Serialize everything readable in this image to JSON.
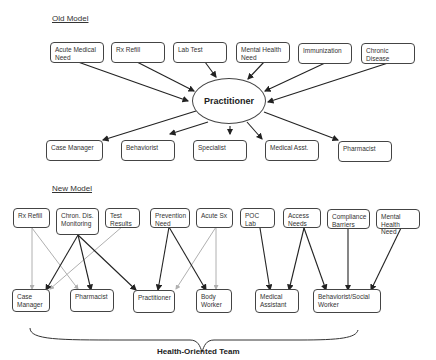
{
  "old_model": {
    "title": "Old Model",
    "center": "Practitioner",
    "inputs": [
      {
        "label": "Acute Medical Need"
      },
      {
        "label": "Rx Refill"
      },
      {
        "label": "Lab Test"
      },
      {
        "label": "Mental Health Need"
      },
      {
        "label": "Immunization"
      },
      {
        "label": "Chronic Disease"
      }
    ],
    "outputs": [
      {
        "label": "Case Manager"
      },
      {
        "label": "Behaviorist"
      },
      {
        "label": "Specialist"
      },
      {
        "label": "Medical Asst."
      },
      {
        "label": "Pharmacist"
      }
    ]
  },
  "new_model": {
    "title": "New Model",
    "inputs": [
      {
        "label": "Rx Refill"
      },
      {
        "label": "Chron. Dis. Monitoring"
      },
      {
        "label": "Test Results"
      },
      {
        "label": "Prevention Need"
      },
      {
        "label": "Acute Sx"
      },
      {
        "label": "POC Lab"
      },
      {
        "label": "Access Needs"
      },
      {
        "label": "Compliance Barriers"
      },
      {
        "label": "Mental Health Need"
      }
    ],
    "outputs": [
      {
        "label": "Case Manager"
      },
      {
        "label": "Pharmacist"
      },
      {
        "label": "Practitioner"
      },
      {
        "label": "Body Worker"
      },
      {
        "label": "Medical Assistant"
      },
      {
        "label": "Behaviorist/Social Worker"
      }
    ],
    "connections": [
      {
        "from": "Rx Refill",
        "to": "Case Manager",
        "style": "light"
      },
      {
        "from": "Rx Refill",
        "to": "Pharmacist",
        "style": "light"
      },
      {
        "from": "Chron. Dis. Monitoring",
        "to": "Case Manager",
        "style": "dark"
      },
      {
        "from": "Chron. Dis. Monitoring",
        "to": "Pharmacist",
        "style": "dark"
      },
      {
        "from": "Chron. Dis. Monitoring",
        "to": "Practitioner",
        "style": "dark"
      },
      {
        "from": "Test Results",
        "to": "Case Manager",
        "style": "light"
      },
      {
        "from": "Prevention Need",
        "to": "Practitioner",
        "style": "dark"
      },
      {
        "from": "Prevention Need",
        "to": "Body Worker",
        "style": "dark"
      },
      {
        "from": "Acute Sx",
        "to": "Practitioner",
        "style": "light"
      },
      {
        "from": "Acute Sx",
        "to": "Body Worker",
        "style": "light"
      },
      {
        "from": "POC Lab",
        "to": "Medical Assistant",
        "style": "dark"
      },
      {
        "from": "Access Needs",
        "to": "Medical Assistant",
        "style": "dark"
      },
      {
        "from": "Access Needs",
        "to": "Behaviorist/Social Worker",
        "style": "dark"
      },
      {
        "from": "Compliance Barriers",
        "to": "Behaviorist/Social Worker",
        "style": "dark"
      },
      {
        "from": "Mental Health Need",
        "to": "Behaviorist/Social Worker",
        "style": "dark"
      }
    ],
    "team_label": "Health-Oriented Team"
  },
  "colors": {
    "dark_arrow": "#222222",
    "light_arrow": "#b0b0b0",
    "box_border": "#444444"
  }
}
